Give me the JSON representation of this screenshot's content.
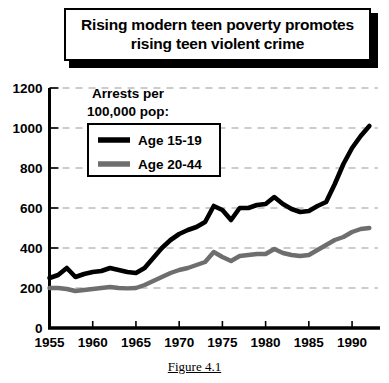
{
  "title": {
    "line1": "Rising modern teen poverty promotes",
    "line2": "rising teen violent crime"
  },
  "caption": "Figure 4.1",
  "legend": {
    "heading_line1": "Arrests per",
    "heading_line2": "100,000 pop:",
    "items": [
      {
        "label": "Age 15-19",
        "color": "#000000"
      },
      {
        "label": "Age 20-44",
        "color": "#6e6e6e"
      }
    ]
  },
  "colors": {
    "series_teen": "#000000",
    "series_adult": "#6e6e6e",
    "gridline": "#999999",
    "axis": "#000000",
    "background": "#ffffff"
  },
  "chart_data": {
    "type": "line",
    "title": "Rising modern teen poverty promotes rising teen violent crime",
    "xlabel": "",
    "ylabel": "Arrests per 100,000 pop:",
    "xlim": [
      1955,
      1993
    ],
    "ylim": [
      0,
      1200
    ],
    "yticks": [
      0,
      200,
      400,
      600,
      800,
      1000,
      1200
    ],
    "ytick_labels": [
      "0",
      "200",
      "400",
      "600",
      "800",
      "1000",
      "1200"
    ],
    "xticks": [
      1955,
      1960,
      1965,
      1970,
      1975,
      1980,
      1985,
      1990
    ],
    "xtick_labels": [
      "1955",
      "1960",
      "1965",
      "1970",
      "1975",
      "1980",
      "1985",
      "1990"
    ],
    "grid": true,
    "grid_style": "dashed-horizontal",
    "legend_position": "upper-left-inside",
    "x": [
      1955,
      1956,
      1957,
      1958,
      1959,
      1960,
      1961,
      1962,
      1963,
      1964,
      1965,
      1966,
      1967,
      1968,
      1969,
      1970,
      1971,
      1972,
      1973,
      1974,
      1975,
      1976,
      1977,
      1978,
      1979,
      1980,
      1981,
      1982,
      1983,
      1984,
      1985,
      1986,
      1987,
      1988,
      1989,
      1990,
      1991,
      1992
    ],
    "series": [
      {
        "name": "Age 15-19",
        "color": "#000000",
        "values": [
          250,
          265,
          300,
          255,
          270,
          280,
          285,
          300,
          290,
          280,
          275,
          300,
          350,
          400,
          440,
          470,
          490,
          505,
          530,
          610,
          590,
          540,
          600,
          600,
          615,
          620,
          655,
          620,
          595,
          580,
          585,
          610,
          630,
          720,
          820,
          900,
          960,
          1010
        ]
      },
      {
        "name": "Age 20-44",
        "color": "#6e6e6e",
        "values": [
          200,
          200,
          195,
          185,
          190,
          195,
          200,
          205,
          200,
          198,
          200,
          215,
          235,
          255,
          275,
          290,
          300,
          315,
          330,
          380,
          355,
          335,
          360,
          365,
          370,
          370,
          395,
          375,
          365,
          360,
          365,
          390,
          415,
          440,
          455,
          480,
          495,
          500
        ]
      }
    ]
  }
}
